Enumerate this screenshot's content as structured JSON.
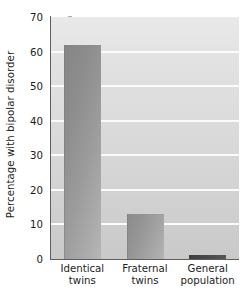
{
  "chart_data": {
    "type": "bar",
    "title": "",
    "subtitle": "",
    "xlabel": "",
    "ylabel": "Percentage with bipolar disorder",
    "categories": [
      "Identical twins",
      "Fraternal twins",
      "General population"
    ],
    "category_lines": [
      [
        "Identical",
        "twins"
      ],
      [
        "Fraternal",
        "twins"
      ],
      [
        "General",
        "population"
      ]
    ],
    "values": [
      62,
      13,
      1
    ],
    "ylim": [
      0,
      70
    ],
    "yticks": [
      0,
      10,
      20,
      30,
      40,
      50,
      60,
      70
    ],
    "ytick_labels": [
      "0",
      "10",
      "20",
      "30",
      "40",
      "50",
      "60",
      "70"
    ],
    "grid": true,
    "grid_axis": "y",
    "grid_color": "#fbfbfb",
    "legend": false,
    "legend_position": "none",
    "bar_colors": [
      "#9a9a9a",
      "#9a9a9a",
      "#484848"
    ],
    "plot_background": "#dcdcdc",
    "figure_background": "#ffffff",
    "axis_color": "#5e5e5e",
    "text_color": "#1c1c1c"
  }
}
